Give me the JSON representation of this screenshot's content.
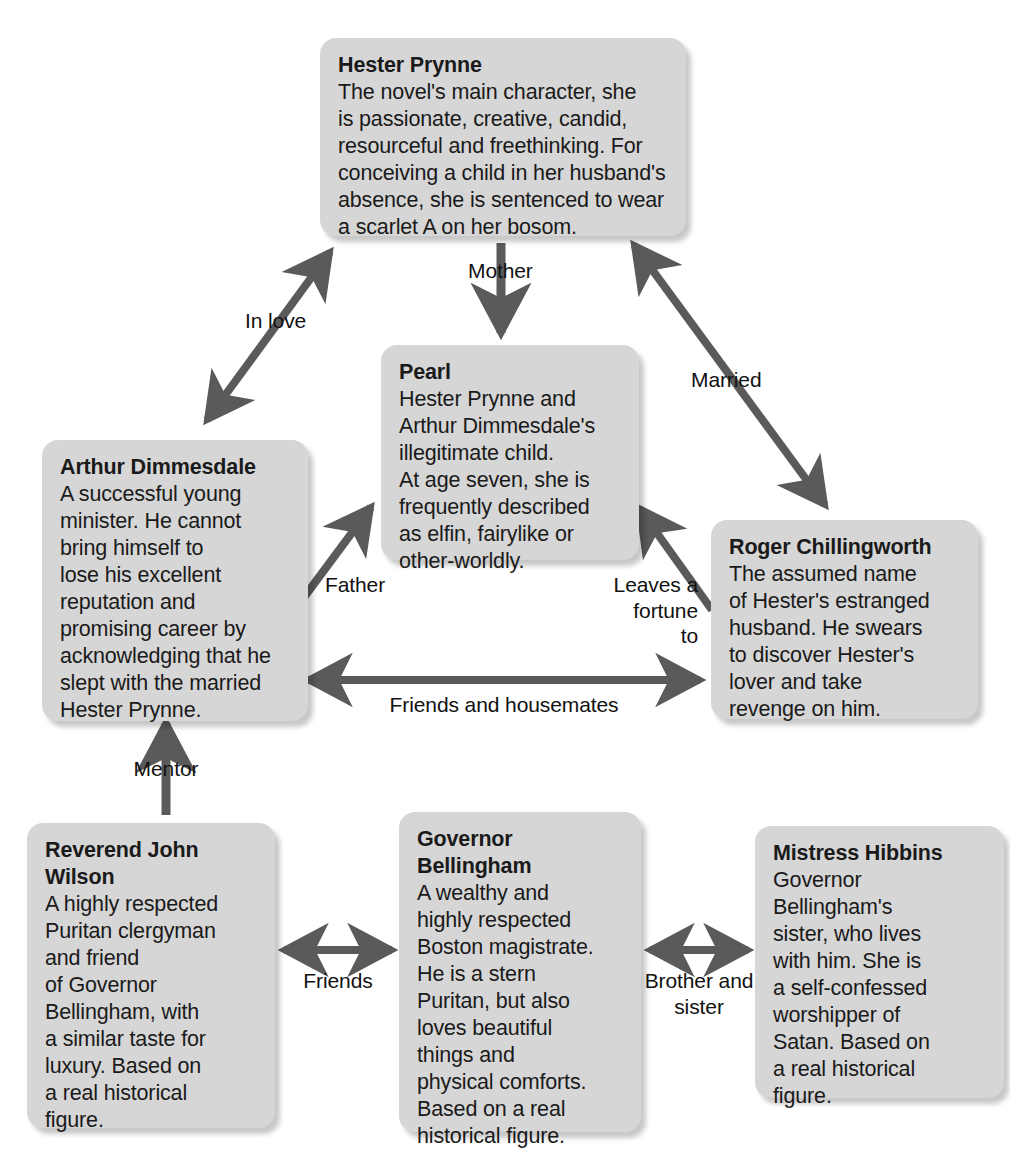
{
  "diagram": {
    "box_fill": "#d6d6d6",
    "arrow_color": "#5a5a5a",
    "text_color": "#1a1a1a"
  },
  "nodes": [
    {
      "id": "hester",
      "name": "Hester Prynne",
      "description": "The novel's main character, she\nis passionate, creative, candid,\nresourceful and freethinking. For\nconceiving a child in her husband's\nabsence, she is sentenced to wear\na scarlet A on her bosom."
    },
    {
      "id": "pearl",
      "name": "Pearl",
      "description": "Hester Prynne and\nArthur Dimmesdale's\nillegitimate child.\nAt age seven, she is\nfrequently described\nas elfin, fairylike or\nother-worldly."
    },
    {
      "id": "arthur",
      "name": "Arthur Dimmesdale",
      "description": "A successful young\nminister. He cannot\nbring himself to\nlose his excellent\nreputation and\npromising career by\nacknowledging that he\nslept with the married\nHester Prynne."
    },
    {
      "id": "roger",
      "name": "Roger Chillingworth",
      "description": "The assumed name\nof Hester's estranged\nhusband. He swears\nto discover Hester's\nlover and take\nrevenge on him."
    },
    {
      "id": "wilson",
      "name": "Reverend John\nWilson",
      "description": "A highly respected\nPuritan clergyman\nand friend\nof Governor\nBellingham, with\na similar taste for\nluxury. Based on\na real historical\nfigure."
    },
    {
      "id": "bellingham",
      "name": "Governor\nBellingham",
      "description": "A wealthy and\nhighly respected\nBoston magistrate.\nHe is a stern\nPuritan, but also\nloves beautiful\nthings and\nphysical comforts.\nBased on a real\nhistorical figure."
    },
    {
      "id": "hibbins",
      "name": "Mistress Hibbins",
      "description": "Governor\nBellingham's\nsister, who lives\nwith him. She is\na self-confessed\nworshipper of\nSatan. Based on\na real historical\nfigure."
    }
  ],
  "edges": [
    {
      "id": "in-love",
      "label": "In love",
      "from": "arthur",
      "to": "hester",
      "heads": "both"
    },
    {
      "id": "mother",
      "label": "Mother",
      "from": "hester",
      "to": "pearl",
      "heads": "end"
    },
    {
      "id": "married",
      "label": "Married",
      "from": "hester",
      "to": "roger",
      "heads": "both"
    },
    {
      "id": "father",
      "label": "Father",
      "from": "arthur",
      "to": "pearl",
      "heads": "end"
    },
    {
      "id": "leaves-a-fortune-to",
      "label": "Leaves a\nfortune\nto",
      "from": "roger",
      "to": "pearl",
      "heads": "end"
    },
    {
      "id": "friends-housemates",
      "label": "Friends and housemates",
      "from": "arthur",
      "to": "roger",
      "heads": "both"
    },
    {
      "id": "mentor",
      "label": "Mentor",
      "from": "wilson",
      "to": "arthur",
      "heads": "end"
    },
    {
      "id": "friends",
      "label": "Friends",
      "from": "wilson",
      "to": "bellingham",
      "heads": "both"
    },
    {
      "id": "brother-and-sister",
      "label": "Brother and\nsister",
      "from": "bellingham",
      "to": "hibbins",
      "heads": "both"
    }
  ]
}
